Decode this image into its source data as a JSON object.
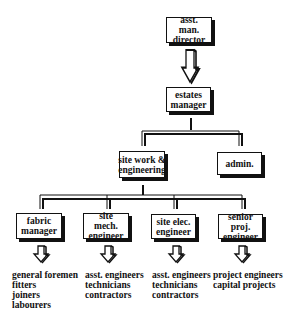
{
  "nodes": {
    "amd": {
      "label": "asst. man. director"
    },
    "estates": {
      "label": "estates manager"
    },
    "sitework": {
      "label": "site work & engineering"
    },
    "admin": {
      "label": "admin."
    },
    "fabric": {
      "label": "fabric manager"
    },
    "mech": {
      "label": "site mech. engineer"
    },
    "elec": {
      "label": "site elec. engineer"
    },
    "senior": {
      "label": "senior proj. engineer"
    }
  },
  "lists": {
    "fabric": [
      "general foremen",
      "fitters",
      "joiners",
      "labourers"
    ],
    "mech": [
      "asst. engineers",
      "technicians",
      "contractors"
    ],
    "elec": [
      "asst. engineers",
      "technicians",
      "contractors"
    ],
    "senior": [
      "project engineers",
      "capital projects"
    ]
  }
}
